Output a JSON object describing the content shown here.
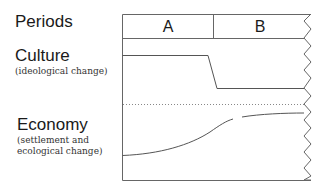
{
  "labels": {
    "periods": "Periods",
    "culture": "Culture",
    "culture_sub": "(ideological change)",
    "economy": "Economy",
    "economy_sub_1": "(settlement and",
    "economy_sub_2": "ecological change)"
  },
  "periods": [
    {
      "name": "A"
    },
    {
      "name": "B"
    }
  ],
  "colors": {
    "line": "#555555",
    "text": "#1a1a1a"
  }
}
